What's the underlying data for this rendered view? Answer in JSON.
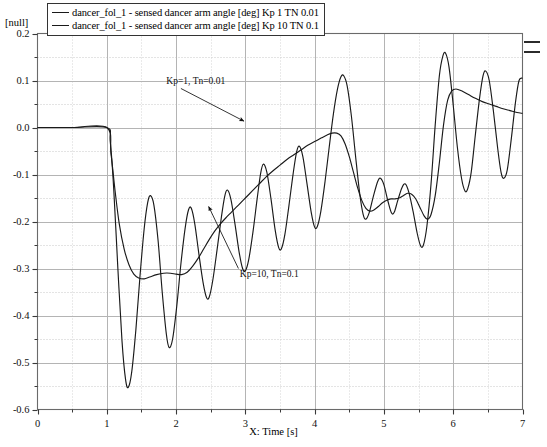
{
  "legend": {
    "position": "top-left",
    "entries": [
      {
        "label": "dancer_fol_1 - sensed dancer arm angle [deg] Kp 1 TN 0.01",
        "color": "#1a1a1a"
      },
      {
        "label": "dancer_fol_1 - sensed dancer arm angle [deg] Kp 10 TN 0.1",
        "color": "#1a1a1a"
      }
    ]
  },
  "axes": {
    "y_unit_label": "[null]",
    "x_axis_title": "X:  Time [s]",
    "x_ticks": [
      "0",
      "1",
      "2",
      "3",
      "4",
      "5",
      "6",
      "7"
    ],
    "y_ticks": [
      "0.2",
      "0.1",
      "0.0",
      "-0.1",
      "-0.2",
      "-0.3",
      "-0.4",
      "-0.5",
      "-0.6"
    ]
  },
  "annotations": [
    {
      "text": "Kp=1,  Tn=0.01",
      "x": 2.05,
      "y": 0.093
    },
    {
      "text": "Kp=10,  Tn=0.1",
      "x": 3.05,
      "y": -0.318
    }
  ],
  "chart_data": {
    "type": "line",
    "title": "",
    "xlabel": "X:  Time [s]",
    "ylabel": "[null]",
    "xlim": [
      0,
      7
    ],
    "ylim": [
      -0.6,
      0.2
    ],
    "grid": true,
    "x_major_step": 1,
    "y_major_step": 0.1,
    "y_minor_step": 0.05,
    "legend_position": "top-left",
    "series": [
      {
        "name": "dancer_fol_1 - sensed dancer arm angle [deg] Kp 1 TN 0.01",
        "color": "#1a1a1a",
        "comment": "fast oscillating response, Kp=1 Tn=0.01",
        "points": [
          [
            0.0,
            0.0
          ],
          [
            0.5,
            0.0
          ],
          [
            1.0,
            0.0
          ],
          [
            1.05,
            -0.03
          ],
          [
            1.1,
            -0.13
          ],
          [
            1.16,
            -0.3
          ],
          [
            1.22,
            -0.455
          ],
          [
            1.27,
            -0.535
          ],
          [
            1.31,
            -0.553
          ],
          [
            1.36,
            -0.52
          ],
          [
            1.42,
            -0.43
          ],
          [
            1.48,
            -0.315
          ],
          [
            1.54,
            -0.215
          ],
          [
            1.59,
            -0.16
          ],
          [
            1.63,
            -0.145
          ],
          [
            1.68,
            -0.165
          ],
          [
            1.74,
            -0.24
          ],
          [
            1.8,
            -0.35
          ],
          [
            1.86,
            -0.44
          ],
          [
            1.9,
            -0.468
          ],
          [
            1.95,
            -0.45
          ],
          [
            2.01,
            -0.38
          ],
          [
            2.07,
            -0.29
          ],
          [
            2.13,
            -0.215
          ],
          [
            2.18,
            -0.175
          ],
          [
            2.22,
            -0.172
          ],
          [
            2.27,
            -0.205
          ],
          [
            2.33,
            -0.27
          ],
          [
            2.39,
            -0.33
          ],
          [
            2.44,
            -0.362
          ],
          [
            2.48,
            -0.36
          ],
          [
            2.53,
            -0.325
          ],
          [
            2.59,
            -0.262
          ],
          [
            2.65,
            -0.195
          ],
          [
            2.7,
            -0.148
          ],
          [
            2.74,
            -0.133
          ],
          [
            2.79,
            -0.152
          ],
          [
            2.85,
            -0.205
          ],
          [
            2.91,
            -0.265
          ],
          [
            2.96,
            -0.3
          ],
          [
            3.0,
            -0.305
          ],
          [
            3.05,
            -0.28
          ],
          [
            3.11,
            -0.222
          ],
          [
            3.17,
            -0.152
          ],
          [
            3.22,
            -0.098
          ],
          [
            3.26,
            -0.078
          ],
          [
            3.31,
            -0.095
          ],
          [
            3.37,
            -0.152
          ],
          [
            3.43,
            -0.218
          ],
          [
            3.48,
            -0.255
          ],
          [
            3.52,
            -0.258
          ],
          [
            3.57,
            -0.228
          ],
          [
            3.63,
            -0.165
          ],
          [
            3.69,
            -0.098
          ],
          [
            3.74,
            -0.052
          ],
          [
            3.78,
            -0.04
          ],
          [
            3.83,
            -0.062
          ],
          [
            3.89,
            -0.12
          ],
          [
            3.95,
            -0.18
          ],
          [
            4.0,
            -0.212
          ],
          [
            4.04,
            -0.21
          ],
          [
            4.09,
            -0.178
          ],
          [
            4.15,
            -0.115
          ],
          [
            4.21,
            -0.042
          ],
          [
            4.27,
            0.028
          ],
          [
            4.33,
            0.082
          ],
          [
            4.38,
            0.108
          ],
          [
            4.42,
            0.11
          ],
          [
            4.47,
            0.088
          ],
          [
            4.53,
            0.025
          ],
          [
            4.59,
            -0.06
          ],
          [
            4.65,
            -0.14
          ],
          [
            4.7,
            -0.185
          ],
          [
            4.74,
            -0.195
          ],
          [
            4.79,
            -0.18
          ],
          [
            4.85,
            -0.145
          ],
          [
            4.91,
            -0.115
          ],
          [
            4.95,
            -0.108
          ],
          [
            5.0,
            -0.122
          ],
          [
            5.06,
            -0.158
          ],
          [
            5.11,
            -0.182
          ],
          [
            5.15,
            -0.18
          ],
          [
            5.2,
            -0.155
          ],
          [
            5.26,
            -0.128
          ],
          [
            5.31,
            -0.12
          ],
          [
            5.36,
            -0.138
          ],
          [
            5.42,
            -0.178
          ],
          [
            5.48,
            -0.225
          ],
          [
            5.53,
            -0.252
          ],
          [
            5.57,
            -0.25
          ],
          [
            5.62,
            -0.21
          ],
          [
            5.68,
            -0.12
          ],
          [
            5.74,
            0.005
          ],
          [
            5.8,
            0.11
          ],
          [
            5.85,
            0.152
          ],
          [
            5.89,
            0.158
          ],
          [
            5.94,
            0.128
          ],
          [
            6.0,
            0.048
          ],
          [
            6.06,
            -0.042
          ],
          [
            6.12,
            -0.108
          ],
          [
            6.17,
            -0.135
          ],
          [
            6.21,
            -0.13
          ],
          [
            6.26,
            -0.095
          ],
          [
            6.32,
            -0.015
          ],
          [
            6.38,
            0.062
          ],
          [
            6.43,
            0.11
          ],
          [
            6.47,
            0.12
          ],
          [
            6.52,
            0.1
          ],
          [
            6.58,
            0.035
          ],
          [
            6.64,
            -0.042
          ],
          [
            6.69,
            -0.095
          ],
          [
            6.73,
            -0.108
          ],
          [
            6.78,
            -0.09
          ],
          [
            6.84,
            -0.022
          ],
          [
            6.9,
            0.055
          ],
          [
            6.95,
            0.1
          ],
          [
            7.0,
            0.105
          ]
        ]
      },
      {
        "name": "dancer_fol_1 - sensed dancer arm angle [deg] Kp 10 TN 0.1",
        "color": "#1a1a1a",
        "comment": "smooth damped response, Kp=10 Tn=0.1",
        "points": [
          [
            0.0,
            0.0
          ],
          [
            0.5,
            0.0
          ],
          [
            1.0,
            0.0
          ],
          [
            1.06,
            -0.055
          ],
          [
            1.12,
            -0.135
          ],
          [
            1.18,
            -0.205
          ],
          [
            1.25,
            -0.258
          ],
          [
            1.32,
            -0.292
          ],
          [
            1.39,
            -0.312
          ],
          [
            1.46,
            -0.32
          ],
          [
            1.54,
            -0.322
          ],
          [
            1.62,
            -0.318
          ],
          [
            1.72,
            -0.313
          ],
          [
            1.82,
            -0.31
          ],
          [
            1.92,
            -0.31
          ],
          [
            2.0,
            -0.312
          ],
          [
            2.08,
            -0.313
          ],
          [
            2.16,
            -0.308
          ],
          [
            2.24,
            -0.295
          ],
          [
            2.32,
            -0.278
          ],
          [
            2.4,
            -0.258
          ],
          [
            2.48,
            -0.238
          ],
          [
            2.56,
            -0.22
          ],
          [
            2.64,
            -0.205
          ],
          [
            2.72,
            -0.192
          ],
          [
            2.8,
            -0.18
          ],
          [
            2.9,
            -0.165
          ],
          [
            3.0,
            -0.15
          ],
          [
            3.1,
            -0.135
          ],
          [
            3.2,
            -0.12
          ],
          [
            3.3,
            -0.105
          ],
          [
            3.4,
            -0.092
          ],
          [
            3.5,
            -0.08
          ],
          [
            3.6,
            -0.068
          ],
          [
            3.7,
            -0.058
          ],
          [
            3.8,
            -0.048
          ],
          [
            3.9,
            -0.038
          ],
          [
            4.0,
            -0.03
          ],
          [
            4.1,
            -0.022
          ],
          [
            4.18,
            -0.016
          ],
          [
            4.25,
            -0.012
          ],
          [
            4.32,
            -0.012
          ],
          [
            4.38,
            -0.018
          ],
          [
            4.44,
            -0.035
          ],
          [
            4.5,
            -0.062
          ],
          [
            4.56,
            -0.095
          ],
          [
            4.62,
            -0.128
          ],
          [
            4.68,
            -0.155
          ],
          [
            4.74,
            -0.172
          ],
          [
            4.8,
            -0.178
          ],
          [
            4.86,
            -0.175
          ],
          [
            4.92,
            -0.168
          ],
          [
            4.98,
            -0.16
          ],
          [
            5.04,
            -0.155
          ],
          [
            5.1,
            -0.152
          ],
          [
            5.16,
            -0.152
          ],
          [
            5.22,
            -0.15
          ],
          [
            5.28,
            -0.145
          ],
          [
            5.34,
            -0.14
          ],
          [
            5.4,
            -0.142
          ],
          [
            5.46,
            -0.152
          ],
          [
            5.52,
            -0.17
          ],
          [
            5.58,
            -0.188
          ],
          [
            5.63,
            -0.195
          ],
          [
            5.68,
            -0.185
          ],
          [
            5.74,
            -0.145
          ],
          [
            5.8,
            -0.075
          ],
          [
            5.86,
            0.005
          ],
          [
            5.92,
            0.058
          ],
          [
            5.98,
            0.078
          ],
          [
            6.04,
            0.082
          ],
          [
            6.12,
            0.078
          ],
          [
            6.22,
            0.07
          ],
          [
            6.32,
            0.062
          ],
          [
            6.42,
            0.055
          ],
          [
            6.52,
            0.05
          ],
          [
            6.62,
            0.045
          ],
          [
            6.72,
            0.04
          ],
          [
            6.82,
            0.036
          ],
          [
            6.92,
            0.032
          ],
          [
            7.0,
            0.03
          ]
        ]
      }
    ]
  }
}
